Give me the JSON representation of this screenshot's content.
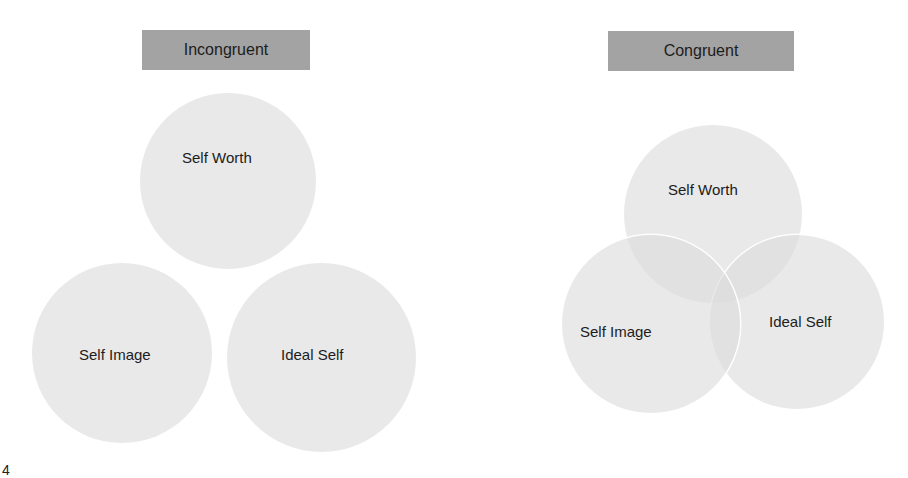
{
  "panels": {
    "incongruent": {
      "title": "Incongruent",
      "circles": {
        "self_worth": "Self Worth",
        "self_image": "Self Image",
        "ideal_self": "Ideal Self"
      }
    },
    "congruent": {
      "title": "Congruent",
      "circles": {
        "self_worth": "Self Worth",
        "self_image": "Self Image",
        "ideal_self": "Ideal Self"
      }
    }
  },
  "page_number": "4",
  "colors": {
    "header_fill": "#a3a3a3",
    "circle_fill": "#dcdcdc",
    "overlap_fill": "#c8c8c8",
    "text": "#1c1c1c"
  }
}
